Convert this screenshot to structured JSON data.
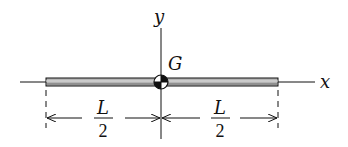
{
  "diagram": {
    "axes": {
      "x_label": "x",
      "y_label": "y"
    },
    "centroid": {
      "label": "G",
      "symbol": "center-of-mass"
    },
    "dimensions": {
      "left": {
        "numerator": "L",
        "denominator": "2"
      },
      "right": {
        "numerator": "L",
        "denominator": "2"
      }
    },
    "colors": {
      "line": "#111111",
      "rod_fill": "#9a9a9a",
      "background": "#ffffff"
    }
  }
}
